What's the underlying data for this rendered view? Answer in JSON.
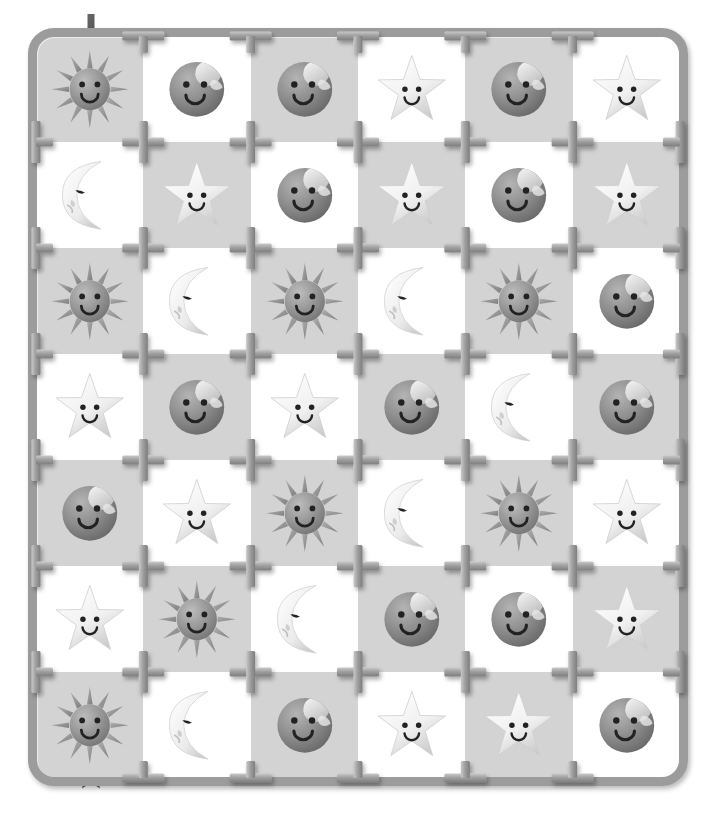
{
  "board": {
    "title": "Celestial Faces Sprue Grid",
    "columns": 6,
    "rows": 7,
    "cell_backgrounds": [
      "gray",
      "white"
    ],
    "colors": {
      "cell_gray": "#d3d3d3",
      "cell_white": "#ffffff",
      "frame": "#9c9c9c",
      "frame_dark": "#7f7f7f",
      "frame_light": "#c9c9c9",
      "page_background": "#ffffff",
      "sun_body": "#8f8f8f",
      "sun_ray": "#9a9a9a",
      "planet_body": "#8a8a8a",
      "star_body": "#f2f2f2",
      "moon_body": "#f0f0f0",
      "face_feature": "#222222",
      "marker": "#5a5a5a"
    },
    "markers": {
      "start": {
        "icon": "down-arrow-icon",
        "label": "start",
        "position": "top-left-above-cell-r1c1"
      },
      "end": {
        "icon": "star-marker-icon",
        "label": "finish",
        "position": "bottom-left-below-cell-r7c1"
      }
    },
    "icon_legend": [
      {
        "key": "sun",
        "icon": "sun-face-icon",
        "label": "Smiling Sun"
      },
      {
        "key": "moon",
        "icon": "moon-face-icon",
        "label": "Sleeping Crescent Moon"
      },
      {
        "key": "star",
        "icon": "star-face-icon",
        "label": "Smiling Star"
      },
      {
        "key": "planet",
        "icon": "planet-face-icon",
        "label": "Smiling Planet"
      }
    ],
    "grid": [
      [
        {
          "icon": "sun",
          "bg": "gray"
        },
        {
          "icon": "planet",
          "bg": "white"
        },
        {
          "icon": "planet",
          "bg": "gray"
        },
        {
          "icon": "star",
          "bg": "white"
        },
        {
          "icon": "planet",
          "bg": "gray"
        },
        {
          "icon": "star",
          "bg": "white"
        }
      ],
      [
        {
          "icon": "moon",
          "bg": "white"
        },
        {
          "icon": "star",
          "bg": "gray"
        },
        {
          "icon": "planet",
          "bg": "white"
        },
        {
          "icon": "star",
          "bg": "gray"
        },
        {
          "icon": "planet",
          "bg": "white"
        },
        {
          "icon": "star",
          "bg": "gray"
        }
      ],
      [
        {
          "icon": "sun",
          "bg": "gray"
        },
        {
          "icon": "moon",
          "bg": "white"
        },
        {
          "icon": "sun",
          "bg": "gray"
        },
        {
          "icon": "moon",
          "bg": "white"
        },
        {
          "icon": "sun",
          "bg": "gray"
        },
        {
          "icon": "planet",
          "bg": "white"
        }
      ],
      [
        {
          "icon": "star",
          "bg": "white"
        },
        {
          "icon": "planet",
          "bg": "gray"
        },
        {
          "icon": "star",
          "bg": "white"
        },
        {
          "icon": "planet",
          "bg": "gray"
        },
        {
          "icon": "moon",
          "bg": "white"
        },
        {
          "icon": "planet",
          "bg": "gray"
        }
      ],
      [
        {
          "icon": "planet",
          "bg": "gray"
        },
        {
          "icon": "star",
          "bg": "white"
        },
        {
          "icon": "sun",
          "bg": "gray"
        },
        {
          "icon": "moon",
          "bg": "white"
        },
        {
          "icon": "sun",
          "bg": "gray"
        },
        {
          "icon": "star",
          "bg": "white"
        }
      ],
      [
        {
          "icon": "star",
          "bg": "white"
        },
        {
          "icon": "sun",
          "bg": "gray"
        },
        {
          "icon": "moon",
          "bg": "white"
        },
        {
          "icon": "planet",
          "bg": "gray"
        },
        {
          "icon": "planet",
          "bg": "white"
        },
        {
          "icon": "star",
          "bg": "gray"
        }
      ],
      [
        {
          "icon": "sun",
          "bg": "gray"
        },
        {
          "icon": "moon",
          "bg": "white"
        },
        {
          "icon": "planet",
          "bg": "gray"
        },
        {
          "icon": "star",
          "bg": "white"
        },
        {
          "icon": "star",
          "bg": "gray"
        },
        {
          "icon": "planet",
          "bg": "white"
        }
      ]
    ]
  }
}
